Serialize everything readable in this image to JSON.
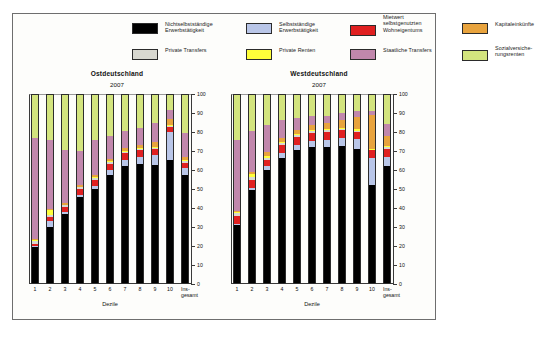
{
  "figure": {
    "legend": {
      "items": [
        {
          "label": "Nichtselbstständige\nErwerbstätigkeit",
          "color": "#000000",
          "row": 0,
          "col": 0
        },
        {
          "label": "Selbstständige\nErwerbstätigkeit",
          "color": "#b9c6e8",
          "row": 0,
          "col": 1
        },
        {
          "label": "Mietwert\nselbstgenutzten\nWohneigentums",
          "color": "#e02020",
          "row": 0,
          "col": 2
        },
        {
          "label": "Kapitaleinkünfte",
          "color": "#e8a33d",
          "row": 0,
          "col": 3
        },
        {
          "label": "Private Transfers",
          "color": "#d8d8d0",
          "row": 1,
          "col": 0
        },
        {
          "label": "Private Renten",
          "color": "#ffff3a",
          "row": 1,
          "col": 1
        },
        {
          "label": "Staatliche Transfers",
          "color": "#c187ac",
          "row": 1,
          "col": 2
        },
        {
          "label": "Sozialversiche-\nrungsrenten",
          "color": "#d3e47e",
          "row": 1,
          "col": 3
        }
      ]
    }
  },
  "chart_data": [
    {
      "type": "bar",
      "stacked": true,
      "panel_id": "east",
      "title": "Ostdeutschland",
      "subtitle": "2007",
      "xlabel": "Dezile",
      "ylabel": "",
      "ylim": [
        0,
        100
      ],
      "yticks": [
        0,
        10,
        20,
        30,
        40,
        50,
        60,
        70,
        80,
        90,
        100
      ],
      "grid": false,
      "legend_position": "top",
      "categories": [
        "1",
        "2",
        "3",
        "4",
        "5",
        "6",
        "7",
        "8",
        "9",
        "10",
        "Ins-\ngesamt"
      ],
      "series": [
        {
          "name": "Nichtselbstständige Erwerbstätigkeit",
          "color": "#000000",
          "values": [
            19.0,
            30.0,
            36.5,
            45.5,
            50.0,
            57.5,
            62.0,
            63.5,
            63.0,
            65.5,
            57.5
          ]
        },
        {
          "name": "Selbstständige Erwerbstätigkeit",
          "color": "#b9c6e8",
          "values": [
            0.8,
            3.0,
            1.5,
            1.5,
            1.5,
            2.5,
            3.5,
            3.5,
            5.0,
            15.0,
            3.5
          ]
        },
        {
          "name": "Mietwert selbstgenutzten Wohneigentums",
          "color": "#e02020",
          "values": [
            1.2,
            2.0,
            2.5,
            3.0,
            3.5,
            3.5,
            3.5,
            3.5,
            3.0,
            2.5,
            3.0
          ]
        },
        {
          "name": "Private Transfers",
          "color": "#d8d8d0",
          "values": [
            1.5,
            1.0,
            0.8,
            0.8,
            0.8,
            0.8,
            0.8,
            0.8,
            0.8,
            0.5,
            0.8
          ]
        },
        {
          "name": "Private Renten",
          "color": "#ffff3a",
          "values": [
            0.3,
            3.0,
            0.4,
            0.4,
            0.4,
            0.4,
            0.4,
            0.4,
            0.4,
            0.4,
            0.4
          ]
        },
        {
          "name": "Kapitaleinkünfte",
          "color": "#e8a33d",
          "values": [
            0.4,
            0.5,
            0.8,
            1.0,
            1.3,
            1.3,
            1.5,
            1.8,
            3.0,
            3.5,
            1.8
          ]
        },
        {
          "name": "Staatliche Transfers",
          "color": "#c187ac",
          "values": [
            53.8,
            36.5,
            28.5,
            17.8,
            18.5,
            12.0,
            9.3,
            9.0,
            9.8,
            4.6,
            13.0
          ]
        },
        {
          "name": "Sozialversicherungsrenten",
          "color": "#d3e47e",
          "values": [
            23.0,
            24.0,
            29.0,
            30.0,
            24.0,
            22.0,
            19.0,
            17.5,
            15.0,
            8.0,
            20.0
          ]
        }
      ]
    },
    {
      "type": "bar",
      "stacked": true,
      "panel_id": "west",
      "title": "Westdeutschland",
      "subtitle": "2007",
      "xlabel": "Dezile",
      "ylabel": "",
      "ylim": [
        0,
        100
      ],
      "yticks": [
        0,
        10,
        20,
        30,
        40,
        50,
        60,
        70,
        80,
        90,
        100
      ],
      "grid": false,
      "legend_position": "top",
      "categories": [
        "1",
        "2",
        "3",
        "4",
        "5",
        "6",
        "7",
        "8",
        "9",
        "10",
        "Ins-\ngesamt"
      ],
      "series": [
        {
          "name": "Nichtselbstständige Erwerbstätigkeit",
          "color": "#000000",
          "values": [
            31.0,
            49.5,
            60.0,
            66.5,
            70.5,
            72.5,
            72.5,
            73.0,
            71.5,
            52.0,
            62.0
          ]
        },
        {
          "name": "Selbstständige Erwerbstätigkeit",
          "color": "#b9c6e8",
          "values": [
            0.6,
            1.0,
            2.0,
            2.5,
            2.8,
            3.0,
            3.5,
            4.0,
            5.0,
            14.5,
            5.0
          ]
        },
        {
          "name": "Mietwert selbstgenutzten Wohneigentums",
          "color": "#e02020",
          "values": [
            3.8,
            4.5,
            3.5,
            4.5,
            4.5,
            4.5,
            4.5,
            4.5,
            4.0,
            4.0,
            4.5
          ]
        },
        {
          "name": "Private Transfers",
          "color": "#d8d8d0",
          "values": [
            2.0,
            1.5,
            1.0,
            0.8,
            0.8,
            0.8,
            0.8,
            0.6,
            0.6,
            0.4,
            0.8
          ]
        },
        {
          "name": "Private Renten",
          "color": "#ffff3a",
          "values": [
            0.4,
            1.5,
            1.2,
            0.8,
            0.6,
            0.6,
            0.6,
            0.6,
            0.6,
            0.5,
            0.6
          ]
        },
        {
          "name": "Kapitaleinkünfte",
          "color": "#e8a33d",
          "values": [
            0.7,
            1.0,
            1.8,
            2.0,
            2.3,
            2.5,
            3.0,
            4.0,
            6.5,
            18.0,
            5.5
          ]
        },
        {
          "name": "Staatliche Transfers",
          "color": "#c187ac",
          "values": [
            37.5,
            22.0,
            14.5,
            9.4,
            6.5,
            5.1,
            4.1,
            3.8,
            3.3,
            2.1,
            6.1
          ]
        },
        {
          "name": "Sozialversicherungsrenten",
          "color": "#d3e47e",
          "values": [
            24.0,
            19.0,
            16.0,
            13.5,
            12.0,
            11.0,
            11.0,
            9.5,
            8.5,
            8.5,
            15.5
          ]
        }
      ]
    }
  ]
}
